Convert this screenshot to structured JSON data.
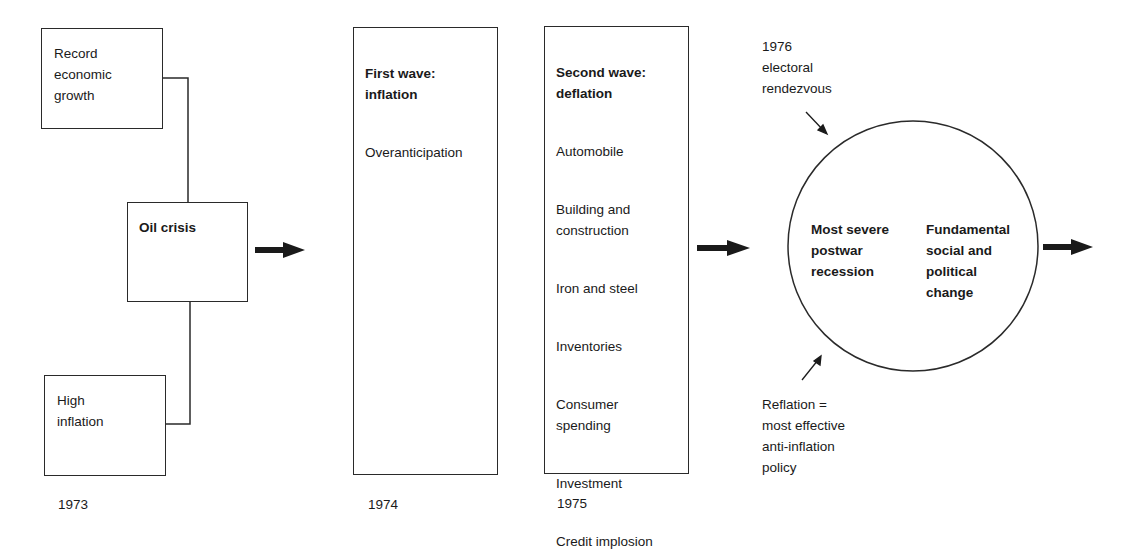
{
  "diagram": {
    "col_1973": {
      "year": "1973",
      "top_box": "Record\neconomic\ngrowth",
      "middle_box": "Oil crisis",
      "bottom_box": "High\ninflation"
    },
    "col_1974": {
      "year": "1974",
      "title": "First wave:\ninflation",
      "items": [
        "Overanticipation"
      ]
    },
    "col_1975": {
      "year": "1975",
      "title": "Second wave:\ndeflation",
      "items": [
        "Automobile",
        "Building and\nconstruction",
        "Iron and steel",
        "Inventories",
        "Consumer\nspending",
        "Investment",
        "Credit implosion"
      ]
    },
    "circle": {
      "left_text": "Most severe\npostwar\nrecession",
      "right_text": "Fundamental\nsocial and\npolitical\nchange",
      "top_annotation": "1976\nelectoral\nrendezvous",
      "bottom_annotation": "Reflation =\nmost effective\nanti-inflation\npolicy"
    },
    "colors": {
      "line": "#2a2a2a",
      "text": "#1a1a1a",
      "background": "#ffffff"
    }
  }
}
